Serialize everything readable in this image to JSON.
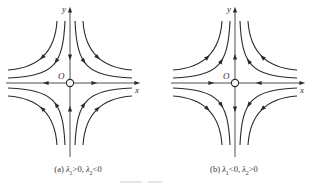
{
  "figure": {
    "panels": [
      {
        "id": "a",
        "caption_prefix": "(a)",
        "lambda1_symbol": "λ",
        "lambda1_sub": "1",
        "lambda1_cond": ">0,",
        "lambda2_symbol": "λ",
        "lambda2_sub": "2",
        "lambda2_cond": "<0",
        "x_label": "x",
        "y_label": "y",
        "origin_label": "O",
        "x_axis_flow": "outward",
        "y_axis_flow": "inward",
        "type": "saddle"
      },
      {
        "id": "b",
        "caption_prefix": "(b)",
        "lambda1_symbol": "λ",
        "lambda1_sub": "1",
        "lambda1_cond": "<0,",
        "lambda2_symbol": "λ",
        "lambda2_sub": "2",
        "lambda2_cond": ">0",
        "x_label": "x",
        "y_label": "y",
        "origin_label": "O",
        "x_axis_flow": "inward",
        "y_axis_flow": "outward",
        "type": "saddle"
      }
    ]
  }
}
